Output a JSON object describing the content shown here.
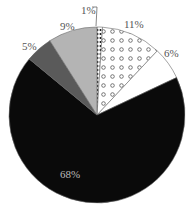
{
  "chart_data": {
    "type": "pie",
    "title": "",
    "start": "12 o'clock",
    "direction": "clockwise",
    "slices": [
      {
        "label": "1%",
        "value": 1,
        "fill": "dark-dotted",
        "color": "#222222"
      },
      {
        "label": "11%",
        "value": 11,
        "fill": "circle-pattern",
        "color": "#ffffff"
      },
      {
        "label": "6%",
        "value": 6,
        "fill": "solid",
        "color": "#ffffff"
      },
      {
        "label": "68%",
        "value": 68,
        "fill": "solid",
        "color": "#0a0a0a"
      },
      {
        "label": "5%",
        "value": 5,
        "fill": "solid",
        "color": "#5a5a5a"
      },
      {
        "label": "9%",
        "value": 9,
        "fill": "solid",
        "color": "#b4b4b4"
      }
    ],
    "legend": null
  },
  "labels": {
    "s1": "1%",
    "s11": "11%",
    "s6": "6%",
    "s68": "68%",
    "s5": "5%",
    "s9": "9%"
  }
}
